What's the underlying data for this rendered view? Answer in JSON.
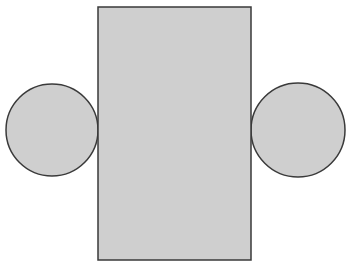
{
  "canvas": {
    "width": 353,
    "height": 272,
    "background": "#ffffff"
  },
  "style": {
    "fill": "#cfcfcf",
    "stroke": "#3a3a3a",
    "stroke_width": 1.5
  },
  "shapes": {
    "rectangle": {
      "x": 98,
      "y": 7,
      "width": 153,
      "height": 253
    },
    "left_circle": {
      "cx": 52,
      "cy": 130,
      "r": 46
    },
    "right_circle": {
      "cx": 298,
      "cy": 130,
      "r": 47
    }
  }
}
